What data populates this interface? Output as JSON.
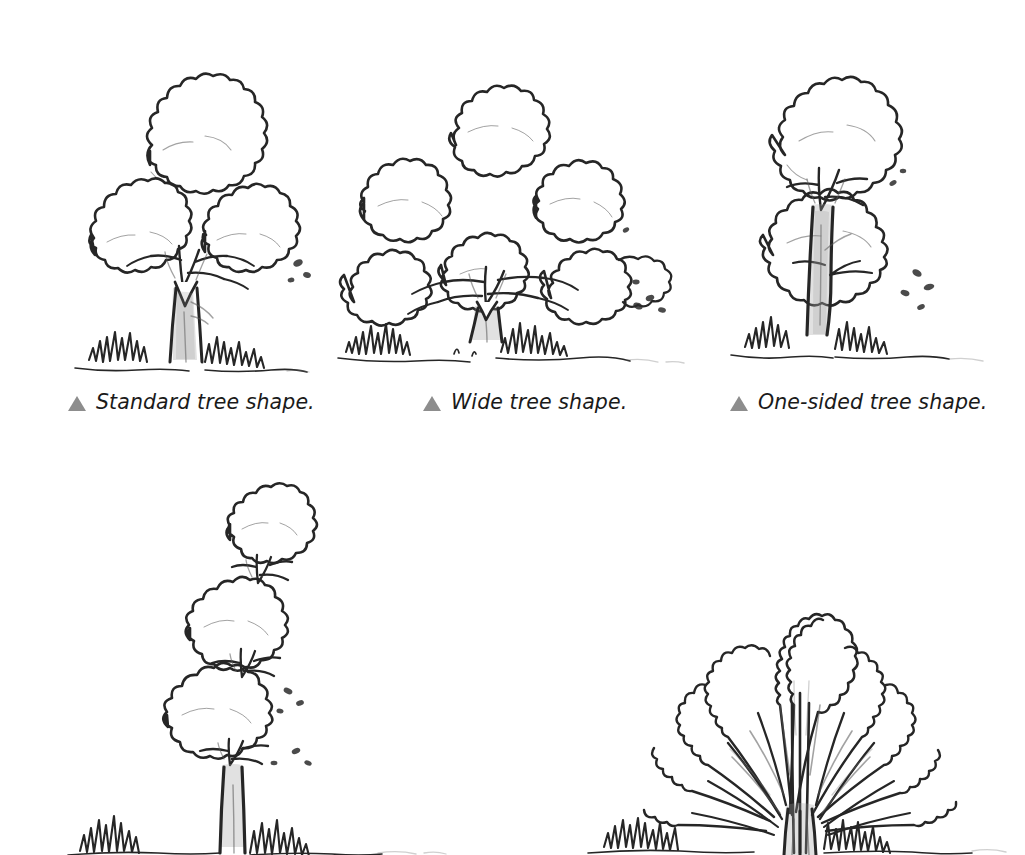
{
  "page": {
    "background_color": "#ffffff",
    "ink_color": "#262626",
    "caption_color": "#1a1a1a",
    "bullet_color": "#8d8d8d",
    "medium": "pencil sketch"
  },
  "figures": [
    {
      "id": "standard-tree",
      "name": "standard-tree-drawing",
      "caption": "Standard tree shape.",
      "bullet": "triangle-bullet",
      "has_caption": true,
      "description": "Rounded broad canopy of three lobed masses on a single forked trunk with grass at the base."
    },
    {
      "id": "wide-tree",
      "name": "wide-tree-drawing",
      "caption": "Wide tree shape.",
      "bullet": "triangle-bullet",
      "has_caption": true,
      "description": "Low spreading canopy of several lobed masses wider than tall on a short trunk."
    },
    {
      "id": "one-sided-tree",
      "name": "one-sided-tree-drawing",
      "caption": "One-sided tree shape.",
      "bullet": "triangle-bullet",
      "has_caption": true,
      "description": "Canopy mass weighted to one side of a leaning trunk."
    },
    {
      "id": "columnar-tree",
      "name": "columnar-tree-drawing",
      "caption": "",
      "bullet": "",
      "has_caption": false,
      "description": "Tall narrow conical tree with stacked tiers on a slender trunk, cropped at page bottom."
    },
    {
      "id": "vase-tree",
      "name": "vase-tree-drawing",
      "caption": "",
      "bullet": "",
      "has_caption": false,
      "description": "Fan or vase shaped multi-stemmed tree with radiating branches, cropped at page bottom."
    }
  ],
  "captions": {
    "standard": "Standard tree shape.",
    "wide": "Wide tree shape.",
    "one_sided": "One-sided tree shape."
  }
}
